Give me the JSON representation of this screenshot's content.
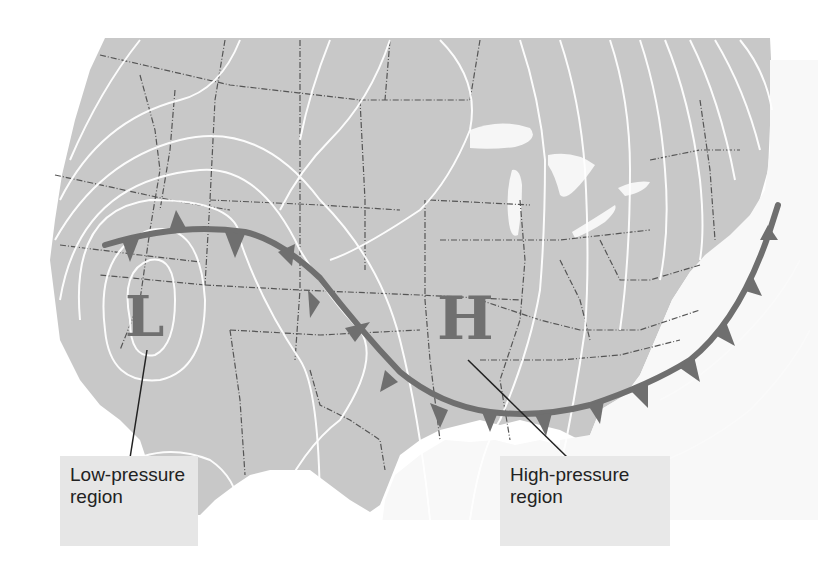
{
  "map": {
    "title": "Weather map of the United States with isobars and a stationary/cold front",
    "colors": {
      "land": "#c8c8c8",
      "water": "#f6f6f6",
      "isobar": "#ffffff",
      "state_border": "#555555",
      "front": "#6f6f6f",
      "pressure_letters": "#707070"
    },
    "pressure_centers": [
      {
        "symbol": "L",
        "meaning": "Low-pressure center"
      },
      {
        "symbol": "H",
        "meaning": "High-pressure center"
      }
    ],
    "front": {
      "type": "cold-front",
      "symbol": "triangles"
    }
  },
  "labels": {
    "low": {
      "line1": "Low-pressure",
      "line2": "region"
    },
    "high": {
      "line1": "High-pressure",
      "line2": "region"
    }
  },
  "letters": {
    "low": "L",
    "high": "H"
  }
}
